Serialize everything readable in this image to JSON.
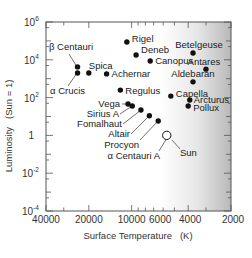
{
  "chart_data": {
    "type": "scatter",
    "title": "",
    "xlabel": "Surface Temperature   (K)",
    "ylabel": "Luminosity   (Sun = 1)",
    "x_scale": "log",
    "y_scale": "log",
    "x_reversed": true,
    "xlim": [
      40000,
      2000
    ],
    "ylim": [
      0.0001,
      1000000
    ],
    "x_ticks": [
      {
        "value": 40000,
        "label": "40000"
      },
      {
        "value": 20000,
        "label": "20000"
      },
      {
        "value": 10000,
        "label": "10000"
      },
      {
        "value": 6000,
        "label": "6000"
      },
      {
        "value": 4000,
        "label": "4000"
      },
      {
        "value": 2000,
        "label": "2000"
      }
    ],
    "y_ticks": [
      {
        "value": 1000000,
        "base": "10",
        "exp": "6"
      },
      {
        "value": 10000,
        "base": "10",
        "exp": "4"
      },
      {
        "value": 100,
        "base": "10",
        "exp": "2"
      },
      {
        "value": 1,
        "base": "1",
        "exp": ""
      },
      {
        "value": 0.01,
        "base": "10",
        "exp": "-2"
      },
      {
        "value": 0.0001,
        "base": "10",
        "exp": "-4"
      }
    ],
    "grid": false,
    "legend": null,
    "background": "white-to-gray horizontal gradient (hot left white, cool right gray)",
    "points": [
      {
        "name": "Rigel",
        "temp": 10800,
        "lum": 87000,
        "label_dx": 5,
        "label_dy": -4,
        "anchor": "start"
      },
      {
        "name": "Deneb",
        "temp": 9300,
        "lum": 18000,
        "label_dx": 5,
        "label_dy": -5,
        "anchor": "start"
      },
      {
        "name": "Canopus",
        "temp": 7400,
        "lum": 8700,
        "label_dx": 5,
        "label_dy": 0,
        "anchor": "start"
      },
      {
        "name": "Betelgeuse",
        "temp": 3700,
        "lum": 23000,
        "label_dx": 6,
        "label_dy": -8,
        "anchor": "middle"
      },
      {
        "name": "Antares",
        "temp": 3000,
        "lum": 3200,
        "label_dx": -2,
        "label_dy": -8,
        "anchor": "middle"
      },
      {
        "name": "Aldebaran",
        "temp": 3700,
        "lum": 680,
        "label_dx": 0,
        "label_dy": -8,
        "anchor": "middle"
      },
      {
        "name": "Capella",
        "temp": 5300,
        "lum": 120,
        "label_dx": 5,
        "label_dy": -3,
        "anchor": "start"
      },
      {
        "name": "Arcturus",
        "temp": 3900,
        "lum": 75,
        "label_dx": 4,
        "label_dy": 0,
        "anchor": "start"
      },
      {
        "name": "Pollux",
        "temp": 4000,
        "lum": 36,
        "label_dx": 5,
        "label_dy": 2,
        "anchor": "start"
      },
      {
        "name": "β Centauri",
        "temp": 24000,
        "lum": 4200,
        "label_dx": null,
        "label_dy": null,
        "anchor": "start"
      },
      {
        "name": "α Crucis",
        "temp": 24000,
        "lum": 2000,
        "label_dx": null,
        "label_dy": null,
        "anchor": "start"
      },
      {
        "name": "Spica",
        "temp": 20000,
        "lum": 2000,
        "label_dx": 0,
        "label_dy": -8,
        "anchor": "start"
      },
      {
        "name": "Achernar",
        "temp": 15000,
        "lum": 1800,
        "label_dx": 5,
        "label_dy": 0,
        "anchor": "start"
      },
      {
        "name": "Regulus",
        "temp": 12000,
        "lum": 250,
        "label_dx": 5,
        "label_dy": 0,
        "anchor": "start"
      },
      {
        "name": "Vega",
        "temp": 10600,
        "lum": 46,
        "label_dx": null,
        "label_dy": null,
        "anchor": "end"
      },
      {
        "name": "Sirius A",
        "temp": 9900,
        "lum": 36,
        "label_dx": null,
        "label_dy": null,
        "anchor": "end"
      },
      {
        "name": "Fomalhaut",
        "temp": 8600,
        "lum": 22,
        "label_dx": null,
        "label_dy": null,
        "anchor": "end"
      },
      {
        "name": "Altair",
        "temp": 7500,
        "lum": 11,
        "label_dx": null,
        "label_dy": null,
        "anchor": "end"
      },
      {
        "name": "Procyon",
        "temp": 6500,
        "lum": 5.8,
        "label_dx": null,
        "label_dy": null,
        "anchor": "end"
      },
      {
        "name": "α Centauri A",
        "temp": 5600,
        "lum": 1.0,
        "label_dx": null,
        "label_dy": null,
        "anchor": "end"
      },
      {
        "name": "Sun",
        "temp": 5800,
        "lum": 1,
        "label_dx": null,
        "label_dy": null,
        "anchor": "start",
        "marker": "open-circle"
      }
    ]
  },
  "axes": {
    "x_title": "Surface Temperature   (K)",
    "y_title": "Luminosity   (Sun = 1)"
  },
  "colors": {
    "marker": "#111111",
    "frame": "#555555",
    "bg_left": "#ffffff",
    "bg_right": "#b9b9b9"
  }
}
